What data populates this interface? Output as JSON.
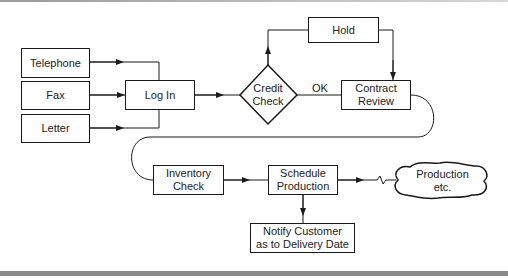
{
  "diagram": {
    "type": "flowchart",
    "nodes": {
      "telephone": "Telephone",
      "fax": "Fax",
      "letter": "Letter",
      "login": "Log In",
      "credit_check_line1": "Credit",
      "credit_check_line2": "Check",
      "hold": "Hold",
      "contract_review_line1": "Contract",
      "contract_review_line2": "Review",
      "inventory_check_line1": "Inventory",
      "inventory_check_line2": "Check",
      "schedule_production_line1": "Schedule",
      "schedule_production_line2": "Production",
      "notify_line1": "Notify Customer",
      "notify_line2": "as to Delivery Date",
      "production_line1": "Production",
      "production_line2": "etc."
    },
    "edge_labels": {
      "ok": "OK"
    },
    "edges": [
      [
        "Telephone",
        "Log In"
      ],
      [
        "Fax",
        "Log In"
      ],
      [
        "Letter",
        "Log In"
      ],
      [
        "Log In",
        "Credit Check"
      ],
      [
        "Credit Check",
        "Hold"
      ],
      [
        "Credit Check",
        "Contract Review",
        "OK"
      ],
      [
        "Hold",
        "Contract Review"
      ],
      [
        "Contract Review",
        "Inventory Check"
      ],
      [
        "Inventory Check",
        "Schedule Production"
      ],
      [
        "Schedule Production",
        "Notify Customer as to Delivery Date"
      ],
      [
        "Schedule Production",
        "Production etc."
      ]
    ],
    "colors": {
      "stroke": "#1a1a1a",
      "background": "#ffffff",
      "bar": "#8a8a8a"
    }
  }
}
